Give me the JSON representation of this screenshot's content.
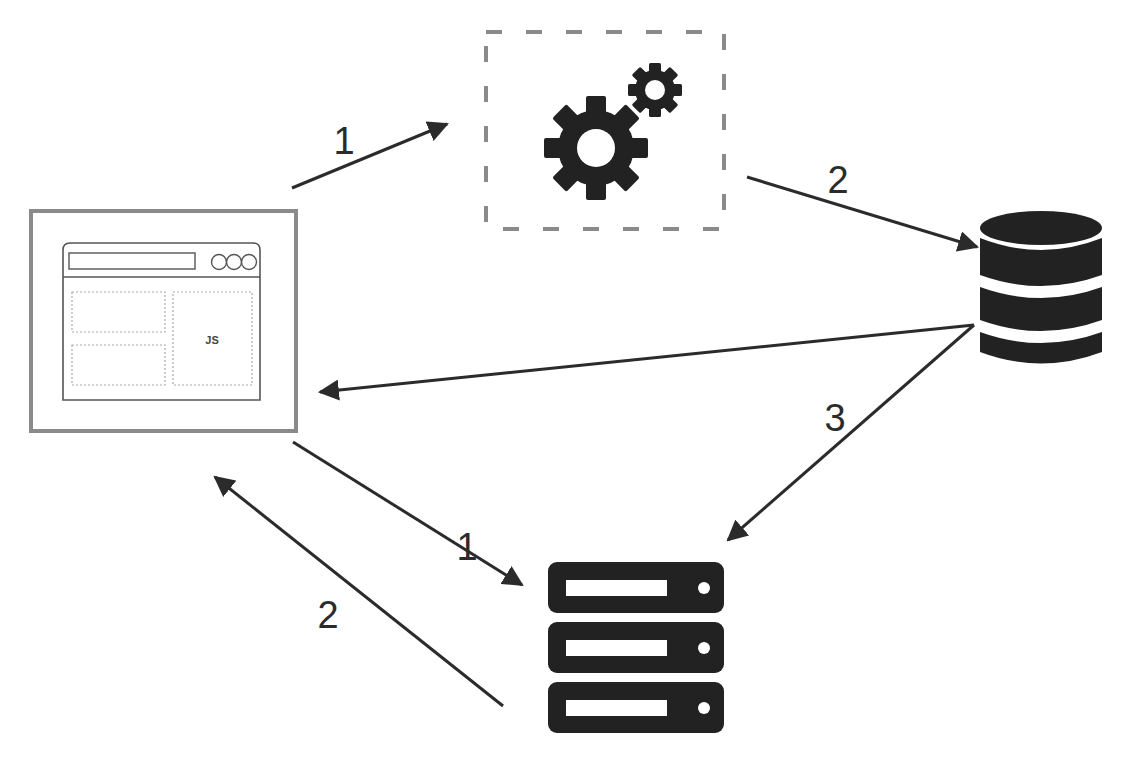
{
  "diagram": {
    "type": "architecture-flow",
    "colors": {
      "background": "#ffffff",
      "icon_fill": "#222222",
      "arrow": "#2b2b2b",
      "browser_border": "#8a8a8a",
      "dashed_border": "#8a8a8a"
    },
    "nodes": {
      "browser": {
        "name": "browser-client",
        "label": "JS"
      },
      "processing": {
        "name": "processing-gears"
      },
      "database": {
        "name": "database"
      },
      "server": {
        "name": "server-stack"
      }
    },
    "edges": [
      {
        "from": "browser",
        "to": "processing",
        "label": "1"
      },
      {
        "from": "processing",
        "to": "database",
        "label": "2"
      },
      {
        "from": "database",
        "to": "browser",
        "label": ""
      },
      {
        "from": "database",
        "to": "server",
        "label": "3"
      },
      {
        "from": "browser",
        "to": "server",
        "label": "1"
      },
      {
        "from": "server",
        "to": "browser",
        "label": "2"
      }
    ]
  }
}
